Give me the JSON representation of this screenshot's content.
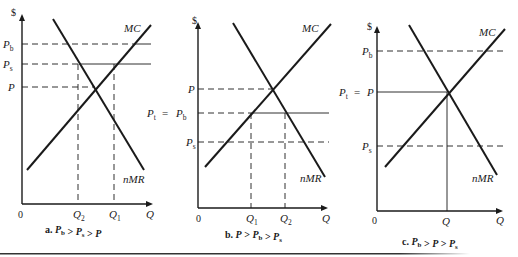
{
  "figure": {
    "rule": {
      "x1": 0,
      "x2": 470,
      "y": 253,
      "color": "#333333"
    },
    "panels": [
      {
        "id": "a",
        "caption": {
          "prefix": "a.",
          "text": "P_b > P_s > P",
          "parts": [
            [
              "P",
              "b"
            ],
            [
              " > ",
              ""
            ],
            [
              "P",
              "s"
            ],
            [
              " > ",
              ""
            ],
            [
              "P",
              ""
            ]
          ],
          "x": 45,
          "y": 233
        },
        "axis": {
          "x0": 22,
          "y0": 204,
          "ytop": 14,
          "xend": 153
        },
        "dollar": {
          "label": "$",
          "x": 11,
          "y": 16
        },
        "origin": {
          "label": "0",
          "x": 18,
          "y": 218
        },
        "qlabel": {
          "label": "Q",
          "x": 146,
          "y": 218
        },
        "mc": {
          "x1": 27,
          "y1": 170,
          "x2": 151,
          "y2": 25,
          "label": "MC",
          "lx": 124,
          "ly": 32
        },
        "nmr": {
          "x1": 53,
          "y1": 19,
          "x2": 144,
          "y2": 170,
          "label": "nMR",
          "lx": 123,
          "ly": 183
        },
        "prices": [
          {
            "main": "P",
            "sub": "b",
            "y": 44,
            "lx": 3,
            "dash_to": 133,
            "solid_to": 151,
            "solid_from": 133
          },
          {
            "main": "P",
            "sub": "s",
            "y": 64,
            "lx": 3,
            "dash_to": 79,
            "solid_from": 79,
            "solid_to": 151
          },
          {
            "main": "P",
            "sub": "",
            "y": 87,
            "lx": 8,
            "dash_to": 95,
            "solid_from": null,
            "solid_to": null
          }
        ],
        "quantities": [
          {
            "main": "Q",
            "sub": "2",
            "x": 78,
            "ytop": 64
          },
          {
            "main": "Q",
            "sub": "1",
            "x": 114,
            "ytop": 64
          }
        ],
        "extra_labels": []
      },
      {
        "id": "b",
        "caption": {
          "prefix": "b.",
          "parts": [
            [
              "P",
              ""
            ],
            [
              " > ",
              ""
            ],
            [
              "P",
              "b"
            ],
            [
              " > ",
              ""
            ],
            [
              "P",
              "s"
            ]
          ],
          "x": 225,
          "y": 238
        },
        "axis": {
          "x0": 198,
          "y0": 208,
          "ytop": 22,
          "xend": 328
        },
        "dollar": {
          "label": "$",
          "x": 192,
          "y": 24
        },
        "origin": {
          "label": "0",
          "x": 196,
          "y": 222
        },
        "qlabel": {
          "label": "Q",
          "x": 322,
          "y": 222
        },
        "mc": {
          "x1": 205,
          "y1": 167,
          "x2": 331,
          "y2": 24,
          "label": "MC",
          "lx": 302,
          "ly": 32
        },
        "nmr": {
          "x1": 233,
          "y1": 23,
          "x2": 325,
          "y2": 177,
          "label": "nMR",
          "lx": 300,
          "ly": 182
        },
        "prices": [
          {
            "main": "P",
            "sub": "",
            "y": 89,
            "lx": 188,
            "dash_to": 272,
            "solid_from": null,
            "solid_to": null
          },
          {
            "main": "P",
            "sub": "b",
            "y": 113,
            "lx": 176,
            "prefix": "P_t = ",
            "prefix_main": "P",
            "prefix_sub": "t",
            "prefix_x": 147,
            "dash_to": 251,
            "solid_from": 251,
            "solid_to": 329
          },
          {
            "main": "P",
            "sub": "s",
            "y": 142,
            "lx": 186,
            "dash_to": 329,
            "solid_from": null,
            "solid_to": null
          }
        ],
        "quantities": [
          {
            "main": "Q",
            "sub": "1",
            "x": 251,
            "ytop": 113
          },
          {
            "main": "Q",
            "sub": "2",
            "x": 285,
            "ytop": 113
          }
        ]
      },
      {
        "id": "c",
        "caption": {
          "prefix": "c.",
          "parts": [
            [
              "P",
              "b"
            ],
            [
              " > ",
              ""
            ],
            [
              "P",
              ""
            ],
            [
              " > ",
              ""
            ],
            [
              "P",
              "s"
            ]
          ],
          "x": 402,
          "y": 245
        },
        "axis": {
          "x0": 377,
          "y0": 211,
          "ytop": 26,
          "xend": 503
        },
        "dollar": {
          "label": "$",
          "x": 367,
          "y": 30
        },
        "origin": {
          "label": "0",
          "x": 372,
          "y": 224
        },
        "qlabel": {
          "label": "Q",
          "x": 496,
          "y": 224
        },
        "mc": {
          "x1": 385,
          "y1": 167,
          "x2": 505,
          "y2": 29,
          "label": "MC",
          "lx": 479,
          "ly": 36
        },
        "nmr": {
          "x1": 409,
          "y1": 25,
          "x2": 497,
          "y2": 175,
          "label": "nMR",
          "lx": 472,
          "ly": 182
        },
        "prices": [
          {
            "main": "P",
            "sub": "b",
            "y": 51,
            "lx": 362,
            "dash_to": 505,
            "solid_from": null,
            "solid_to": null,
            "dashed_all": true
          },
          {
            "main": "P",
            "sub": "",
            "y": 92,
            "lx": 367,
            "prefix": "P_t = ",
            "prefix_main": "P",
            "prefix_sub": "t",
            "prefix_x": 339,
            "solid_only": true,
            "dash_to": 447
          },
          {
            "main": "P",
            "sub": "s",
            "y": 146,
            "lx": 362,
            "dash_to": 505,
            "solid_from": null,
            "solid_to": null,
            "dashed_all": true
          }
        ],
        "quantities": [
          {
            "main": "Q",
            "sub": "",
            "x": 447,
            "ytop": 92,
            "solid": true
          }
        ]
      }
    ]
  }
}
